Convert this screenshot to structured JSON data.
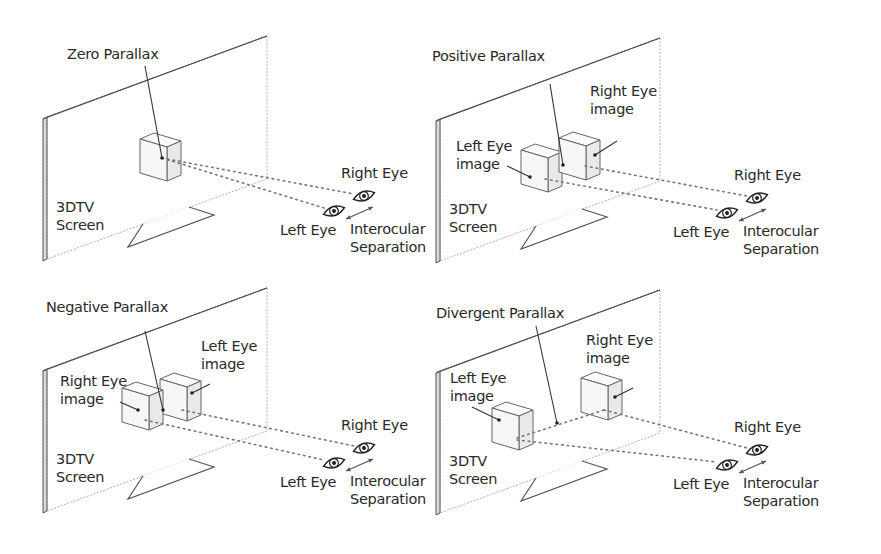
{
  "figure": {
    "panels": [
      {
        "id": "zero",
        "title": "Zero Parallax",
        "screen_label": [
          "3DTV",
          "Screen"
        ],
        "left_eye_label": "Left Eye",
        "right_eye_label": "Right Eye",
        "separation_label": [
          "Interocular",
          "Separation"
        ],
        "image_labels": []
      },
      {
        "id": "positive",
        "title": "Positive Parallax",
        "screen_label": [
          "3DTV",
          "Screen"
        ],
        "left_eye_label": "Left Eye",
        "right_eye_label": "Right Eye",
        "separation_label": [
          "Interocular",
          "Separation"
        ],
        "image_labels": [
          {
            "eye": "left",
            "text": [
              "Left Eye",
              "image"
            ]
          },
          {
            "eye": "right",
            "text": [
              "Right Eye",
              "image"
            ]
          }
        ]
      },
      {
        "id": "negative",
        "title": "Negative Parallax",
        "screen_label": [
          "3DTV",
          "Screen"
        ],
        "left_eye_label": "Left Eye",
        "right_eye_label": "Right Eye",
        "separation_label": [
          "Interocular",
          "Separation"
        ],
        "image_labels": [
          {
            "eye": "right",
            "text": [
              "Right Eye",
              "image"
            ]
          },
          {
            "eye": "left",
            "text": [
              "Left Eye",
              "image"
            ]
          }
        ]
      },
      {
        "id": "divergent",
        "title": "Divergent Parallax",
        "screen_label": [
          "3DTV",
          "Screen"
        ],
        "left_eye_label": "Left Eye",
        "right_eye_label": "Right Eye",
        "separation_label": [
          "Interocular",
          "Separation"
        ],
        "image_labels": [
          {
            "eye": "left",
            "text": [
              "Left Eye",
              "image"
            ]
          },
          {
            "eye": "right",
            "text": [
              "Right Eye",
              "image"
            ]
          }
        ]
      }
    ],
    "icons": {
      "eye": "eye-icon",
      "separation": "double-arrow-icon",
      "screen": "tv-screen-icon",
      "cube": "cube-icon"
    }
  }
}
